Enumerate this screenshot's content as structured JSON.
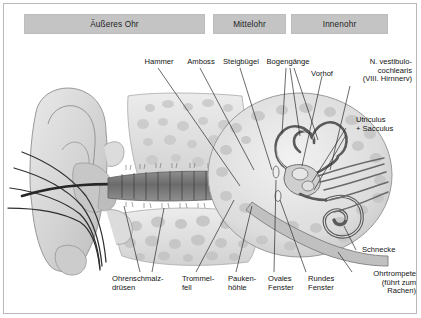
{
  "figure": {
    "language": "de",
    "sections": [
      {
        "id": "outer",
        "label": "Äußeres Ohr"
      },
      {
        "id": "middle",
        "label": "Mittelohr"
      },
      {
        "id": "inner",
        "label": "Innenohr"
      }
    ],
    "labels": {
      "hammer": "Hammer",
      "amboss": "Amboss",
      "steigbuegel": "Steigbügel",
      "bogengaenge": "Bogengänge",
      "vorhof": "Vorhof",
      "nerv": "N. vestibulo-\ncochlearis\n(VIII. Hirnnerv)",
      "utriculus": "Utriculus\n+ Sacculus",
      "schnecke": "Schnecke",
      "ohrtrompete": "Ohrtrompete\n(führt zum\nRachen)",
      "ohrenschmalz": "Ohrenschmalz-\ndrüsen",
      "trommelfell": "Trommel-\nfell",
      "paukenhoehle": "Pauken-\nhöhle",
      "ovales": "Ovales\nFenster",
      "rundes": "Rundes\nFenster"
    },
    "colors": {
      "section_bar": "#c4c4c4",
      "frame": "#b9b9b9",
      "text": "#131313",
      "bone_light": "#e3e3e3",
      "bone_mid": "#c9c9c9",
      "bone_dark": "#9a9a9a",
      "canal_dark": "#6f6f6f",
      "leader_line": "#2b2b2b",
      "background": "#ffffff"
    }
  }
}
